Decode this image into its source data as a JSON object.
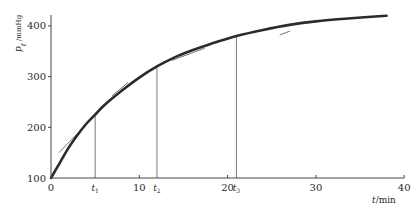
{
  "chart_data": {
    "type": "line",
    "title": "",
    "xlabel": "t/min",
    "ylabel": "p_t /mmHg",
    "ylabel_symbol": "p",
    "ylabel_subscript": "t",
    "ylabel_unit": "/mmHg",
    "xlabel_symbol": "t",
    "xlabel_unit": "/min",
    "xlim": [
      0,
      40
    ],
    "ylim": [
      100,
      420
    ],
    "grid": false,
    "legend": null,
    "x_ticks": [
      {
        "value": 0,
        "label": "0"
      },
      {
        "value": 10,
        "label": "10"
      },
      {
        "value": 20,
        "label": "20"
      },
      {
        "value": 30,
        "label": "30"
      },
      {
        "value": 40,
        "label": "40"
      }
    ],
    "y_ticks": [
      {
        "value": 100,
        "label": "100"
      },
      {
        "value": 200,
        "label": "200"
      },
      {
        "value": 300,
        "label": "300"
      },
      {
        "value": 400,
        "label": "400"
      }
    ],
    "series": [
      {
        "name": "p_t",
        "x": [
          0,
          1,
          2,
          3,
          4,
          5,
          6,
          8,
          10,
          12,
          14,
          16,
          18,
          21,
          24,
          27,
          30,
          34,
          38
        ],
        "values": [
          100,
          130,
          160,
          185,
          207,
          225,
          243,
          272,
          298,
          320,
          338,
          352,
          364,
          380,
          392,
          402,
          409,
          415,
          420
        ]
      }
    ],
    "markers": [
      {
        "label": "t",
        "sub": "1",
        "x": 5,
        "y": 225
      },
      {
        "label": "t",
        "sub": "2",
        "x": 12,
        "y": 320
      },
      {
        "label": "t",
        "sub": "3",
        "x": 21,
        "y": 380
      }
    ],
    "tangents": [
      {
        "x1": 0.9,
        "y1": 150,
        "x2": 3.4,
        "y2": 195
      },
      {
        "x1": 6.9,
        "y1": 262,
        "x2": 8.7,
        "y2": 288
      },
      {
        "x1": 13.7,
        "y1": 332,
        "x2": 17.4,
        "y2": 356
      },
      {
        "x1": 25.9,
        "y1": 382,
        "x2": 27.1,
        "y2": 390
      }
    ],
    "annotations": [
      "t1",
      "t2",
      "t3"
    ]
  },
  "style": {
    "curve_color": "#2b2b2b",
    "axis_color": "#444444",
    "guide_color": "#555555",
    "tangent_color": "#555555"
  }
}
